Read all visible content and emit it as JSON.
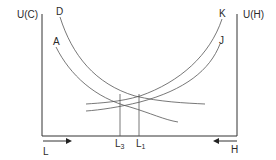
{
  "diagram": {
    "axes": {
      "left_label": "U(C)",
      "right_label": "U(H)",
      "bottom_left_label": "L",
      "bottom_right_label": "H",
      "left_arrow_direction": "right",
      "right_arrow_direction": "left"
    },
    "curves": [
      {
        "label": "D",
        "side": "left",
        "shape": "convex-decreasing"
      },
      {
        "label": "A",
        "side": "left",
        "shape": "convex-decreasing"
      },
      {
        "label": "K",
        "side": "right",
        "shape": "convex-increasing"
      },
      {
        "label": "J",
        "side": "right",
        "shape": "convex-increasing"
      }
    ],
    "vertical_markers": [
      {
        "label": "L",
        "subscript": "3"
      },
      {
        "label": "L",
        "subscript": "1"
      }
    ],
    "colors": {
      "line": "#555555",
      "axis": "#333333",
      "text": "#2a2a2a"
    }
  }
}
